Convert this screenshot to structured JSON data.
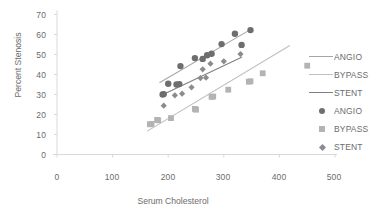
{
  "chart_data": {
    "type": "scatter",
    "title": "",
    "xlabel": "Serum Cholesterol",
    "ylabel": "Percent Stenosis",
    "xlim": [
      0,
      500
    ],
    "ylim": [
      0,
      70
    ],
    "xticks": [
      0,
      100,
      200,
      300,
      400,
      500
    ],
    "yticks": [
      0,
      10,
      20,
      30,
      40,
      50,
      60,
      70
    ],
    "grid": false,
    "legend_position": "right",
    "legend_entries": [
      {
        "label": "ANGIO",
        "kind": "line",
        "color": "#a6a6a6"
      },
      {
        "label": "BYPASS",
        "kind": "line",
        "color": "#bfbfbf"
      },
      {
        "label": "STENT",
        "kind": "line",
        "color": "#808080"
      },
      {
        "label": "ANGIO",
        "kind": "marker",
        "marker": "circle",
        "color": "#6e6e6e"
      },
      {
        "label": "BYPASS",
        "kind": "marker",
        "marker": "square",
        "color": "#b3b3b3"
      },
      {
        "label": "STENT",
        "kind": "marker",
        "marker": "diamond",
        "color": "#8c8c8c"
      }
    ],
    "series": [
      {
        "name": "ANGIO",
        "marker": "circle",
        "color": "#6e6e6e",
        "points": [
          [
            190,
            30.0
          ],
          [
            192,
            30.2
          ],
          [
            200,
            35.4
          ],
          [
            215,
            35.0
          ],
          [
            220,
            35.2
          ],
          [
            222,
            44.2
          ],
          [
            248,
            48.2
          ],
          [
            262,
            47.8
          ],
          [
            270,
            49.6
          ],
          [
            278,
            50.4
          ],
          [
            296,
            55.2
          ],
          [
            320,
            60.4
          ],
          [
            332,
            54.8
          ],
          [
            348,
            62.2
          ]
        ],
        "trendline": {
          "color": "#a6a6a6",
          "x0": 185,
          "y0": 36.0,
          "x1": 350,
          "y1": 62.8
        }
      },
      {
        "name": "BYPASS",
        "marker": "square",
        "color": "#b3b3b3",
        "points": [
          [
            167,
            15.1
          ],
          [
            170,
            15.3
          ],
          [
            180,
            17.3
          ],
          [
            182,
            17.1
          ],
          [
            205,
            18.2
          ],
          [
            248,
            22.8
          ],
          [
            250,
            22.4
          ],
          [
            278,
            28.8
          ],
          [
            281,
            29.0
          ],
          [
            308,
            32.4
          ],
          [
            345,
            36.4
          ],
          [
            348,
            36.6
          ],
          [
            370,
            40.6
          ],
          [
            450,
            44.4
          ]
        ],
        "trendline": {
          "color": "#bfbfbf",
          "x0": 163,
          "y0": 11.8,
          "x1": 418,
          "y1": 54.4
        }
      },
      {
        "name": "STENT",
        "marker": "diamond",
        "color": "#8c8c8c",
        "points": [
          [
            192,
            24.4
          ],
          [
            212,
            29.6
          ],
          [
            225,
            30.4
          ],
          [
            242,
            33.6
          ],
          [
            258,
            38.2
          ],
          [
            262,
            42.6
          ],
          [
            268,
            38.4
          ],
          [
            276,
            45.4
          ],
          [
            300,
            46.6
          ],
          [
            330,
            50.2
          ]
        ],
        "trendline": {
          "color": "#808080",
          "x0": 186,
          "y0": 29.4,
          "x1": 332,
          "y1": 48.6
        }
      }
    ]
  },
  "axes": {
    "x_title": "Serum Cholesterol",
    "y_title": "Percent Stenosis",
    "x_tick_labels": [
      "0",
      "100",
      "200",
      "300",
      "400",
      "500"
    ],
    "y_tick_labels": [
      "0",
      "10",
      "20",
      "30",
      "40",
      "50",
      "60",
      "70"
    ]
  },
  "legend": {
    "items": [
      {
        "label": "ANGIO"
      },
      {
        "label": "BYPASS"
      },
      {
        "label": "STENT"
      },
      {
        "label": "ANGIO"
      },
      {
        "label": "BYPASS"
      },
      {
        "label": "STENT"
      }
    ]
  }
}
